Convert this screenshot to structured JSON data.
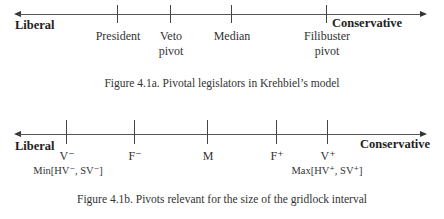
{
  "figure_a": {
    "left_label": "Liberal",
    "right_label": "Conservative",
    "ticks": [
      {
        "x": 117,
        "label_line1": "President",
        "label_line2": ""
      },
      {
        "x": 170,
        "label_line1": "Veto",
        "label_line2": "pivot"
      },
      {
        "x": 231,
        "label_line1": "Median",
        "label_line2": ""
      },
      {
        "x": 326,
        "label_line1": "Filibuster",
        "label_line2": "pivot"
      }
    ],
    "caption": "Figure 4.1a. Pivotal legislators in Krehbiel’s model"
  },
  "figure_b": {
    "left_label": "Liberal",
    "right_label": "Conservative",
    "ticks": [
      {
        "x": 66,
        "label": "V⁻",
        "sublabel": "Min[HV⁻, SV⁻]"
      },
      {
        "x": 134,
        "label": "F⁻",
        "sublabel": ""
      },
      {
        "x": 207,
        "label": "M",
        "sublabel": ""
      },
      {
        "x": 276,
        "label": "F⁺",
        "sublabel": ""
      },
      {
        "x": 327,
        "label": "V⁺",
        "sublabel": "Max[HV⁺, SV⁺]"
      }
    ],
    "caption": "Figure 4.1b. Pivots relevant for the size of the gridlock interval"
  }
}
